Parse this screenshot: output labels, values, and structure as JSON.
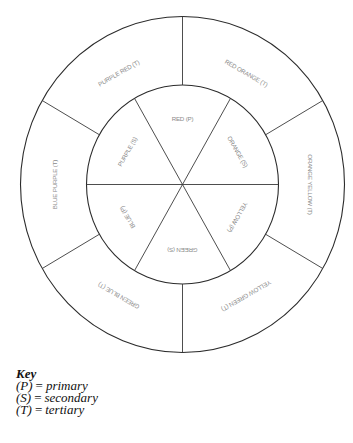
{
  "diagram": {
    "type": "color-wheel",
    "center": [
      182.5,
      184.5
    ],
    "outer_ring": {
      "rx": 162,
      "ry": 168
    },
    "inner_ring": {
      "rx": 96,
      "ry": 99.5
    },
    "line_color": "#2b2b2b",
    "label_color": "#8a8a8a",
    "inner_segments": [
      {
        "label": "RED (P)",
        "angle": 0
      },
      {
        "label": "ORANGE (S)",
        "angle": 60
      },
      {
        "label": "YELLOW (P)",
        "angle": 120
      },
      {
        "label": "GREEN (S)",
        "angle": 180
      },
      {
        "label": "BLUE (P)",
        "angle": 240
      },
      {
        "label": "PURPLE (S)",
        "angle": 300
      }
    ],
    "outer_segments": [
      {
        "label": "RED ORANGE (T)",
        "angle": 30
      },
      {
        "label": "ORANGE YELLOW (T)",
        "angle": 90
      },
      {
        "label": "YELLOW GREEN (T)",
        "angle": 150
      },
      {
        "label": "GREEN BLUE (T)",
        "angle": 210
      },
      {
        "label": "BLUE PURPLE (T)",
        "angle": 270
      },
      {
        "label": "PURPLE RED (T)",
        "angle": 330
      }
    ]
  },
  "key": {
    "title": "Key",
    "entries": [
      {
        "symbol": "(P)",
        "equals": "=",
        "meaning": "primary"
      },
      {
        "symbol": "(S)",
        "equals": "=",
        "meaning": "secondary"
      },
      {
        "symbol": "(T)",
        "equals": "=",
        "meaning": "tertiary"
      }
    ]
  }
}
